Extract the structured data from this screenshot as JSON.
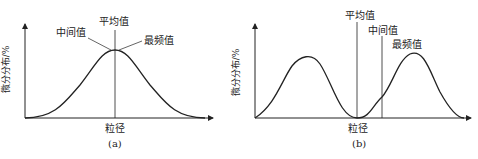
{
  "panels": [
    {
      "id": "a",
      "caption": "(a)",
      "xlabel": "粒径",
      "ylabel": "微分分布/%",
      "labels": {
        "mean": "平均值",
        "median": "中间值",
        "mode": "最频值"
      },
      "distribution": "unimodal symmetric"
    },
    {
      "id": "b",
      "caption": "(b)",
      "xlabel": "粒径",
      "ylabel": "微分分布/%",
      "labels": {
        "mean": "平均值",
        "median": "中间值",
        "mode": "最频值"
      },
      "distribution": "bimodal"
    }
  ],
  "colors": {
    "line": "#222222",
    "background": "#ffffff"
  }
}
